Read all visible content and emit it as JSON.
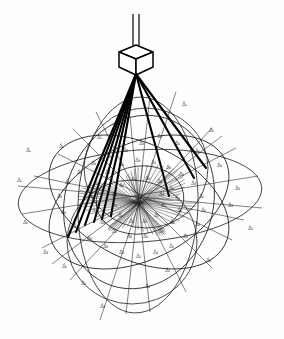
{
  "figure": {
    "caption": "",
    "background_color": "#ffffff",
    "ink_color": "#000000"
  },
  "apparatus": {
    "suspension": {
      "name": "suspension-rod",
      "top_x": 136,
      "top_y": 14,
      "bottom_y": 48,
      "width": 7
    },
    "cube": {
      "name": "cubical-body",
      "center_x": 136,
      "center_y": 59,
      "half_width": 17,
      "half_height": 14,
      "iso_offset": 7,
      "label": ""
    },
    "apex": {
      "x": 136,
      "y": 74,
      "label": "apex"
    }
  },
  "hub": {
    "name": "radial-hub",
    "center_x": 138,
    "center_y": 203,
    "ray_count": 72,
    "inner_radius": 1.0,
    "outer_radius_x": 62,
    "outer_radius_y": 42
  },
  "thick_rays": {
    "count": 9,
    "endpoints": [
      {
        "x": 68,
        "y": 236
      },
      {
        "x": 75,
        "y": 232
      },
      {
        "x": 84,
        "y": 224
      },
      {
        "x": 93,
        "y": 222
      },
      {
        "x": 101,
        "y": 219
      },
      {
        "x": 110,
        "y": 216
      },
      {
        "x": 168,
        "y": 196
      },
      {
        "x": 193,
        "y": 178
      },
      {
        "x": 205,
        "y": 168
      }
    ]
  },
  "chart_data": {
    "type": "scatter",
    "xlabel": "",
    "ylabel": "",
    "ellipses": [
      {
        "name": "equatorial-ellipse",
        "cx": 140,
        "cy": 196,
        "rx": 122,
        "ry": 46,
        "rot": -4
      },
      {
        "name": "meridian-ellipse-a",
        "cx": 138,
        "cy": 205,
        "rx": 60,
        "ry": 108,
        "rot": 2
      },
      {
        "name": "meridian-ellipse-b",
        "cx": 146,
        "cy": 168,
        "rx": 62,
        "ry": 60,
        "rot": 0
      },
      {
        "name": "meridian-ellipse-c",
        "cx": 132,
        "cy": 242,
        "rx": 65,
        "ry": 62,
        "rot": 0
      },
      {
        "name": "oblique-ellipse-d",
        "cx": 139,
        "cy": 202,
        "rx": 96,
        "ry": 58,
        "rot": 26
      },
      {
        "name": "oblique-ellipse-e",
        "cx": 139,
        "cy": 202,
        "rx": 96,
        "ry": 58,
        "rot": -26
      },
      {
        "name": "oblique-ellipse-f",
        "cx": 139,
        "cy": 202,
        "rx": 74,
        "ry": 88,
        "rot": 18
      },
      {
        "name": "small-ellipse-g",
        "cx": 140,
        "cy": 200,
        "rx": 44,
        "ry": 34,
        "rot": -8
      }
    ],
    "labels": [
      {
        "t": "d₁",
        "x": 183,
        "y": 104
      },
      {
        "t": "d₂",
        "x": 210,
        "y": 130
      },
      {
        "t": "d₃",
        "x": 118,
        "y": 122
      },
      {
        "t": "d₄",
        "x": 98,
        "y": 137
      },
      {
        "t": "d₅",
        "x": 60,
        "y": 146
      },
      {
        "t": "d₆",
        "x": 27,
        "y": 150
      },
      {
        "t": "d₇",
        "x": 18,
        "y": 180
      },
      {
        "t": "d₈",
        "x": 24,
        "y": 222
      },
      {
        "t": "d₉",
        "x": 63,
        "y": 266
      },
      {
        "t": "d₁₀",
        "x": 101,
        "y": 306
      },
      {
        "t": "d₁₁",
        "x": 146,
        "y": 286
      },
      {
        "t": "d₁₂",
        "x": 207,
        "y": 260
      },
      {
        "t": "d₁₃",
        "x": 249,
        "y": 228
      },
      {
        "t": "d₁₄",
        "x": 236,
        "y": 188
      },
      {
        "t": "d₁₅",
        "x": 218,
        "y": 165
      },
      {
        "t": "d₁₆",
        "x": 196,
        "y": 151
      },
      {
        "t": "d₁₇",
        "x": 176,
        "y": 143
      },
      {
        "t": "d₁₈",
        "x": 158,
        "y": 136
      },
      {
        "t": "d₁₉",
        "x": 140,
        "y": 143
      },
      {
        "t": "d₂₀",
        "x": 124,
        "y": 150
      },
      {
        "t": "d₂₁",
        "x": 108,
        "y": 156
      },
      {
        "t": "d₂₂",
        "x": 92,
        "y": 163
      },
      {
        "t": "d₂₃",
        "x": 78,
        "y": 172
      },
      {
        "t": "d₂₄",
        "x": 66,
        "y": 182
      },
      {
        "t": "d₂₅",
        "x": 58,
        "y": 196
      },
      {
        "t": "d₂₆",
        "x": 62,
        "y": 212
      },
      {
        "t": "d₂₇",
        "x": 74,
        "y": 226
      },
      {
        "t": "d₂₈",
        "x": 88,
        "y": 238
      },
      {
        "t": "d₂₉",
        "x": 104,
        "y": 246
      },
      {
        "t": "d₃₀",
        "x": 120,
        "y": 252
      },
      {
        "t": "d₃₁",
        "x": 137,
        "y": 256
      },
      {
        "t": "d₃₂",
        "x": 154,
        "y": 252
      },
      {
        "t": "d₃₃",
        "x": 170,
        "y": 246
      },
      {
        "t": "d₃₄",
        "x": 184,
        "y": 236
      },
      {
        "t": "d₃₅",
        "x": 196,
        "y": 224
      },
      {
        "t": "d₃₆",
        "x": 202,
        "y": 210
      },
      {
        "t": "d₃₇",
        "x": 200,
        "y": 196
      },
      {
        "t": "d₃₈",
        "x": 192,
        "y": 183
      },
      {
        "t": "d₃₉",
        "x": 180,
        "y": 174
      },
      {
        "t": "d₄₀",
        "x": 167,
        "y": 167
      },
      {
        "t": "d₄₁",
        "x": 152,
        "y": 162
      },
      {
        "t": "d₄₂",
        "x": 136,
        "y": 160
      },
      {
        "t": "d₄₃",
        "x": 120,
        "y": 164
      },
      {
        "t": "d₄₄",
        "x": 106,
        "y": 172
      },
      {
        "t": "d₄₅",
        "x": 95,
        "y": 183
      },
      {
        "t": "d₄₆",
        "x": 90,
        "y": 196
      },
      {
        "t": "d₄₇",
        "x": 93,
        "y": 210
      },
      {
        "t": "d₄₈",
        "x": 101,
        "y": 222
      },
      {
        "t": "d₄₉",
        "x": 113,
        "y": 231
      },
      {
        "t": "d₅₀",
        "x": 128,
        "y": 236
      },
      {
        "t": "d₅₁",
        "x": 144,
        "y": 236
      },
      {
        "t": "d₅₂",
        "x": 159,
        "y": 231
      },
      {
        "t": "d₅₃",
        "x": 171,
        "y": 222
      },
      {
        "t": "d₅₄",
        "x": 178,
        "y": 210
      },
      {
        "t": "d₅₅",
        "x": 176,
        "y": 198
      },
      {
        "t": "d₅₆",
        "x": 170,
        "y": 188
      },
      {
        "t": "d₅₇",
        "x": 158,
        "y": 181
      },
      {
        "t": "d₅₈",
        "x": 146,
        "y": 178
      },
      {
        "t": "d₅₉",
        "x": 132,
        "y": 179
      },
      {
        "t": "d₆₀",
        "x": 120,
        "y": 185
      },
      {
        "t": "d₆₁",
        "x": 113,
        "y": 194
      },
      {
        "t": "d₆₂",
        "x": 113,
        "y": 205
      },
      {
        "t": "d₆₃",
        "x": 119,
        "y": 215
      },
      {
        "t": "d₆₄",
        "x": 130,
        "y": 221
      },
      {
        "t": "d₆₅",
        "x": 143,
        "y": 221
      },
      {
        "t": "d₆₆",
        "x": 155,
        "y": 215
      },
      {
        "t": "d₆₇",
        "x": 162,
        "y": 205
      },
      {
        "t": "d₆₈",
        "x": 160,
        "y": 194
      },
      {
        "t": "d₆₉",
        "x": 229,
        "y": 205
      },
      {
        "t": "d₇₀",
        "x": 44,
        "y": 252
      },
      {
        "t": "d₇₁",
        "x": 82,
        "y": 283
      },
      {
        "t": "d₇₂",
        "x": 166,
        "y": 270
      }
    ]
  }
}
